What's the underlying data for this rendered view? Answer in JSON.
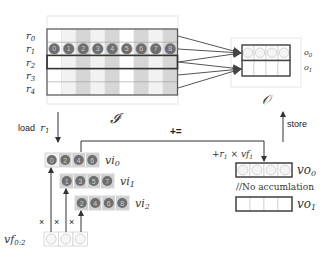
{
  "input_matrix": {
    "symbol": "I",
    "row_labels": [
      "r0",
      "r1",
      "r2",
      "r3",
      "r4"
    ],
    "highlighted_row": "r1",
    "r1_values": [
      "0",
      "1",
      "2",
      "3",
      "4",
      "5",
      "6",
      "7",
      "8"
    ],
    "column_shading": [
      "white",
      "light",
      "gray",
      "light",
      "gray",
      "white",
      "gray",
      "light",
      "gray"
    ],
    "window_rows": [
      "r2",
      "r3",
      "r4"
    ]
  },
  "output_matrix": {
    "symbol": "O",
    "row_labels": [
      "o0",
      "o1"
    ],
    "o0_cells": 4,
    "o1_cells": 4
  },
  "connections": [
    {
      "from": [
        "r0",
        "r1",
        "r2"
      ],
      "to": "o0"
    },
    {
      "from": [
        "r2",
        "r3",
        "r4"
      ],
      "to": "o1"
    }
  ],
  "labels": {
    "load": "load",
    "load_var": "r",
    "load_sub": "1",
    "store": "store",
    "accumulate": "+=",
    "accumulate_expr_prefix": "+r",
    "accumulate_expr_sub1": "1",
    "accumulate_expr_mid": " × vf",
    "accumulate_expr_sub2": "1",
    "no_accumulation": "//No accumlation",
    "input_symbol": "𝓘",
    "output_symbol": "𝒪",
    "times": "×"
  },
  "vector_inputs": [
    {
      "name": "vi",
      "sub": "0",
      "values": [
        "0",
        "2",
        "4",
        "6"
      ]
    },
    {
      "name": "vi",
      "sub": "1",
      "values": [
        "1",
        "3",
        "5",
        "7"
      ]
    },
    {
      "name": "vi",
      "sub": "2",
      "values": [
        "2",
        "4",
        "6",
        "8"
      ]
    }
  ],
  "filter_vector": {
    "name": "vf",
    "sub": "0:2",
    "cells": 3
  },
  "vector_outputs": [
    {
      "name": "vo",
      "sub": "0",
      "cells": 4,
      "filled": true
    },
    {
      "name": "vo",
      "sub": "1",
      "cells": 4,
      "filled": false
    }
  ],
  "row_label_text": {
    "r0": {
      "v": "r",
      "s": "0"
    },
    "r1": {
      "v": "r",
      "s": "1"
    },
    "r2": {
      "v": "r",
      "s": "2"
    },
    "r3": {
      "v": "r",
      "s": "3"
    },
    "r4": {
      "v": "r",
      "s": "4"
    }
  },
  "out_label_text": {
    "o0": {
      "v": "o",
      "s": "0"
    },
    "o1": {
      "v": "o",
      "s": "1"
    }
  },
  "colors": {
    "grid_border": "#555555",
    "cell_white": "#ffffff",
    "cell_light": "#f2f2f2",
    "cell_gray": "#d6d6d6",
    "dot_fill": "#6e6e6e",
    "dot_digit": "#d0d0d0",
    "line": "#333333",
    "frame": "#e6e6e6"
  }
}
